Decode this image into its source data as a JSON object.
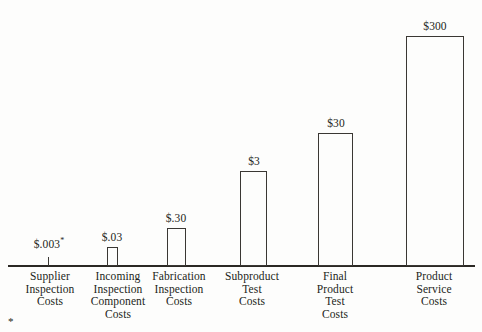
{
  "chart_data": {
    "type": "bar",
    "title": "",
    "subtitle": "",
    "xlabel": "",
    "ylabel": "",
    "grid": false,
    "legend": "none",
    "scale": "logarithmic",
    "axis_range_note": "no y-axis or tick labels drawn; only a horizontal baseline",
    "categories": [
      "Supplier\nInspection\nCosts",
      "Incoming\nInspection\nComponent\nCosts",
      "Fabrication\nInspection\nCosts",
      "Subproduct\nTest\nCosts",
      "Final\nProduct\nTest\nCosts",
      "Product\nService\nCosts"
    ],
    "values": [
      0.003,
      0.03,
      0.3,
      3,
      30,
      300
    ],
    "value_labels": [
      "$.003",
      "$.03",
      "$.30",
      "$3",
      "$30",
      "$300"
    ],
    "footnote_marker_on_first_value": "*",
    "footnote_marker": "*",
    "bar_style": "outline",
    "bar_fill": "#fdfdfc",
    "bar_stroke": "#3a3733",
    "axis_color": "#2b2824",
    "text_color": "#231f20",
    "background": "#fdfdfc"
  },
  "bars": [
    {
      "label": "$.003",
      "superscript": "*",
      "left": 48,
      "width": 0,
      "top": 257,
      "height": 9,
      "value_left": 22,
      "value_top": 238,
      "value_width": 54
    },
    {
      "label": "$.03",
      "superscript": "",
      "left": 107,
      "width": 11,
      "top": 247,
      "height": 19,
      "value_left": 85,
      "value_top": 231,
      "value_width": 54
    },
    {
      "label": "$.30",
      "superscript": "",
      "left": 167,
      "width": 19,
      "top": 228,
      "height": 38,
      "value_left": 149,
      "value_top": 212,
      "value_width": 54
    },
    {
      "label": "$3",
      "superscript": "",
      "left": 240,
      "width": 27,
      "top": 171,
      "height": 95,
      "value_left": 227,
      "value_top": 155,
      "value_width": 54
    },
    {
      "label": "$30",
      "superscript": "",
      "left": 318,
      "width": 35,
      "top": 133,
      "height": 133,
      "value_left": 309,
      "value_top": 117,
      "value_width": 54
    },
    {
      "label": "$300",
      "superscript": "",
      "left": 406,
      "width": 58,
      "top": 36,
      "height": 230,
      "value_left": 408,
      "value_top": 20,
      "value_width": 54
    }
  ],
  "category_labels": [
    {
      "text": "Supplier\nInspection\nCosts",
      "left": 12,
      "width": 76
    },
    {
      "text": "Incoming\nInspection\nComponent\nCosts",
      "left": 78,
      "width": 80
    },
    {
      "text": "Fabrication\nInspection\nCosts",
      "left": 141,
      "width": 76
    },
    {
      "text": "Subproduct\nTest\nCosts",
      "left": 214,
      "width": 76
    },
    {
      "text": "Final\nProduct\nTest\nCosts",
      "left": 297,
      "width": 76
    },
    {
      "text": "Product\nService\nCosts",
      "left": 396,
      "width": 76
    }
  ],
  "footnote": {
    "marker": "*"
  }
}
